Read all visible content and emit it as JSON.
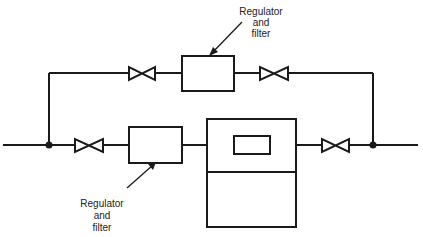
{
  "diagram": {
    "type": "gas sampling flow schematic",
    "colors": {
      "line": "#1a1a1a",
      "background": "#ffffff"
    },
    "labels": {
      "top_regulator": [
        "Regulator",
        "and",
        "filter"
      ],
      "bottom_regulator": [
        "Regulator",
        "and",
        "filter"
      ]
    },
    "components": [
      {
        "id": "main-line",
        "kind": "pipe"
      },
      {
        "id": "bypass-line",
        "kind": "pipe"
      },
      {
        "id": "junction-left",
        "kind": "junction"
      },
      {
        "id": "junction-right",
        "kind": "junction"
      },
      {
        "id": "valve-top-left",
        "kind": "valve"
      },
      {
        "id": "regulator-filter-top",
        "kind": "regulator-filter"
      },
      {
        "id": "valve-top-right",
        "kind": "valve"
      },
      {
        "id": "valve-bottom-left",
        "kind": "valve"
      },
      {
        "id": "regulator-filter-bottom",
        "kind": "regulator-filter"
      },
      {
        "id": "analyzer",
        "kind": "instrument"
      },
      {
        "id": "valve-bottom-right",
        "kind": "valve"
      }
    ]
  }
}
